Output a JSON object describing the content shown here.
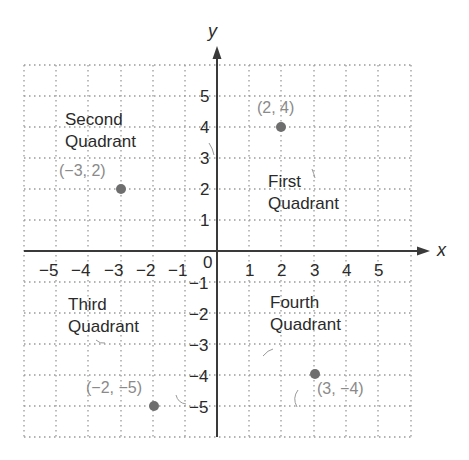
{
  "diagram": {
    "type": "coordinate-plane",
    "axes": {
      "x_label": "x",
      "y_label": "y",
      "origin_label": "0",
      "x_ticks": [
        "−5",
        "−4",
        "−3",
        "−2",
        "−1",
        "1",
        "2",
        "3",
        "4",
        "5"
      ],
      "y_ticks": [
        "5",
        "4",
        "3",
        "2",
        "1",
        "−1",
        "−2",
        "−3",
        "−4",
        "−5"
      ]
    },
    "quadrants": {
      "second": {
        "line1": "Second",
        "line2": "Quadrant"
      },
      "first": {
        "line1": "First",
        "line2": "Quadrant"
      },
      "third": {
        "line1": "Third",
        "line2": "Quadrant"
      },
      "fourth": {
        "line1": "Fourth",
        "line2": "Quadrant"
      }
    },
    "points": [
      {
        "x": -3,
        "y": 2,
        "label": "(−3, 2)"
      },
      {
        "x": 2,
        "y": 4,
        "label": "(2, 4)"
      },
      {
        "x": -2,
        "y": -5,
        "label": "(−2, −5)"
      },
      {
        "x": 3,
        "y": -4,
        "label": "(3, −4)"
      }
    ],
    "colors": {
      "axis": "#3a3a3a",
      "grid": "#9a9a9a",
      "point": "#6e6e6e",
      "text": "#2a2a2a",
      "coord_text": "#8a8a8a"
    }
  }
}
